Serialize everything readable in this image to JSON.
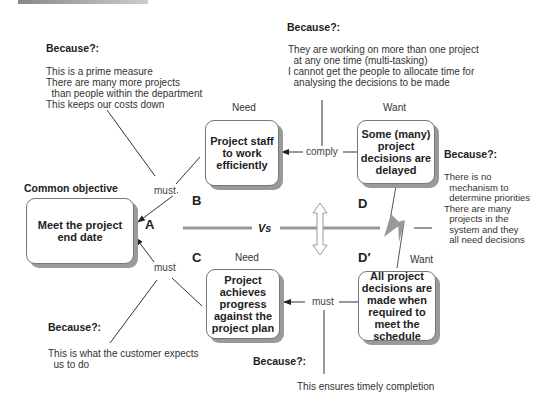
{
  "diagram": {
    "type": "conflict-resolution-diagram",
    "common_objective_label": "Common objective",
    "vs_label": "Vs",
    "boxes": {
      "A": {
        "letter": "A",
        "text": "Meet the project end date"
      },
      "B": {
        "letter": "B",
        "heading": "Need",
        "text": "Project staff to work efficiently"
      },
      "C": {
        "letter": "C",
        "heading": "Need",
        "text": "Project achieves progress against the project plan"
      },
      "D": {
        "letter": "D",
        "heading": "Want",
        "text": "Some (many) project decisions are delayed"
      },
      "Dprime": {
        "letter": "D′",
        "heading": "Want",
        "text": "All project decisions are made when required to meet the schedule"
      }
    },
    "connectors": {
      "A_B": "must",
      "A_C": "must",
      "B_D": "comply",
      "C_Dprime": "must"
    },
    "assumptions": {
      "A_B": {
        "heading": "Because?:",
        "text": "This is a prime measure\nThere are many more projects\n  than people within the department\nThis keeps our costs down"
      },
      "B_D": {
        "heading": "Because?:",
        "text": "They are working on more than one project\n  at any one time (multi-tasking)\nI cannot get the people to allocate time for\n  analysing the decisions to be made"
      },
      "D_Dprime": {
        "heading": "Because?:",
        "text": "There is no\n  mechanism to\n  determine priorities\nThere are many\n  projects in the\n  system and they\n  all need decisions"
      },
      "A_C": {
        "heading": "Because?:",
        "text": "This is what the customer expects\n  us to do"
      },
      "C_Dprime": {
        "heading": "Because?:",
        "text": "This ensures timely completion"
      }
    }
  }
}
